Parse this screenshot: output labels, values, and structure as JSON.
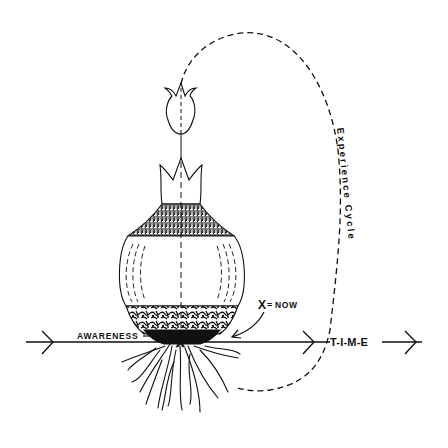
{
  "diagram": {
    "type": "concept-illustration",
    "colors": {
      "ink": "#111111",
      "background": "#ffffff"
    },
    "labels": {
      "experience_cycle": "Experience Cycle",
      "x_marker": "X",
      "x_equals": "=",
      "now": "NOW",
      "awareness": "AWARENESS",
      "time": "T-I-M-E"
    },
    "elements": [
      {
        "id": "flower",
        "description": "tulip flower at top of stem"
      },
      {
        "id": "bulb",
        "description": "onion-like bulb with shaded neck and base layers"
      },
      {
        "id": "roots",
        "description": "tangled roots below bulb"
      },
      {
        "id": "time-axis",
        "description": "horizontal arrow line with chevrons pointing right"
      },
      {
        "id": "experience-cycle-path",
        "description": "dashed loop from flower over the top, down the right side, back to roots"
      },
      {
        "id": "now-pointer",
        "description": "curved arrow from X=NOW label to the X on the time axis"
      }
    ]
  }
}
